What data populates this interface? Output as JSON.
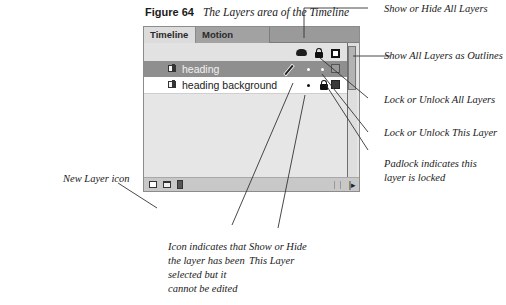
{
  "caption": {
    "figure_number": "Figure 64",
    "title": "The Layers area of the Timeline"
  },
  "panel": {
    "tabs": [
      {
        "label": "Timeline",
        "active": true
      },
      {
        "label": "Motion Editor",
        "active": false
      }
    ],
    "header_icons": [
      "eye-icon",
      "lock-icon",
      "outline-icon"
    ],
    "layers": [
      {
        "name": "heading",
        "selected": true,
        "status_icon": "pencil-crossed-icon",
        "visible": "dot",
        "locked": "dot",
        "outline_color": "#9a9a9a"
      },
      {
        "name": "heading background",
        "selected": false,
        "status_icon": "",
        "visible": "dot",
        "locked": "lock",
        "outline_color": "#3a3a3a"
      }
    ],
    "bottom_icons": [
      "new-layer-icon",
      "new-folder-icon",
      "delete-icon"
    ]
  },
  "annotations": {
    "show_hide_all": "Show or Hide All Layers",
    "outlines_all": "Show All Layers as Outlines",
    "lock_all": "Lock or Unlock All Layers",
    "lock_this": "Lock or Unlock This Layer",
    "padlock_line1": "Padlock indicates this",
    "padlock_line2": "layer is locked",
    "new_layer": "New Layer icon",
    "pencil_line1": "Icon indicates that",
    "pencil_line2": "the layer has been",
    "pencil_line3": "selected but it",
    "pencil_line4": "cannot be edited",
    "show_hide_this_line1": "Show or Hide",
    "show_hide_this_line2": "This Layer"
  },
  "colors": {
    "selected_row": "#8f8f8f",
    "panel_bg": "#e6e6e6",
    "tabbar_bg": "#9a9a9a"
  }
}
